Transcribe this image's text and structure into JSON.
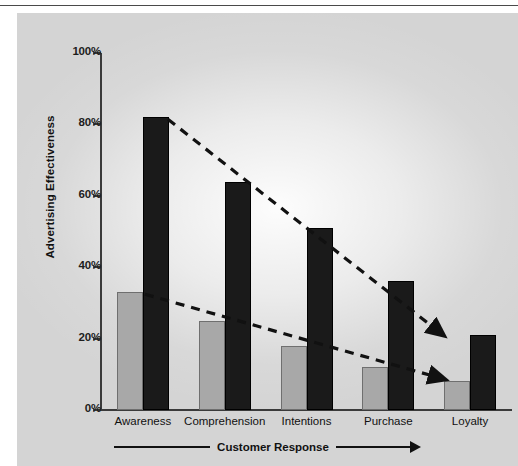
{
  "chart_data": {
    "type": "bar",
    "title": "",
    "xlabel": "Customer Response",
    "ylabel": "Advertising Effectiveness",
    "categories": [
      "Awareness",
      "Comprehension",
      "Intentions",
      "Purchase",
      "Loyalty"
    ],
    "ylim": [
      0,
      100
    ],
    "ytick_labels": [
      "0%",
      "20%",
      "40%",
      "60%",
      "80%",
      "100%"
    ],
    "ytick_values": [
      0,
      20,
      40,
      60,
      80,
      100
    ],
    "grid": false,
    "legend": "none",
    "series": [
      {
        "name": "light-series",
        "color": "#a8a8a8",
        "values": [
          33,
          25,
          18,
          12,
          8
        ]
      },
      {
        "name": "dark-series",
        "color": "#1a1a1a",
        "values": [
          82,
          64,
          51,
          36,
          21
        ]
      }
    ],
    "annotations": [
      {
        "name": "upper-trend-line",
        "style": "dashed-arrow",
        "from": {
          "category": "Awareness",
          "value": 82
        },
        "to": {
          "category": "Loyalty",
          "value": 21
        }
      },
      {
        "name": "lower-trend-line",
        "style": "dashed-arrow",
        "from": {
          "category": "Awareness",
          "value": 33
        },
        "to": {
          "category": "Loyalty",
          "value": 8
        }
      }
    ]
  },
  "axis": {
    "y_title": "Advertising Effectiveness",
    "x_caption": "Customer Response",
    "ticks": [
      {
        "label": "100%",
        "value": 100
      },
      {
        "label": "80%",
        "value": 80
      },
      {
        "label": "60%",
        "value": 60
      },
      {
        "label": "40%",
        "value": 40
      },
      {
        "label": "20%",
        "value": 20
      },
      {
        "label": "0%",
        "value": 0
      }
    ]
  },
  "categories": [
    {
      "label": "Awareness"
    },
    {
      "label": "Comprehension"
    },
    {
      "label": "Intentions"
    },
    {
      "label": "Purchase"
    },
    {
      "label": "Loyalty"
    }
  ],
  "colors": {
    "panel_background": "#d4d4d4",
    "light_bar": "#a8a8a8",
    "dark_bar": "#1a1a1a",
    "axis": "#3a3a3a",
    "text": "#111111"
  }
}
